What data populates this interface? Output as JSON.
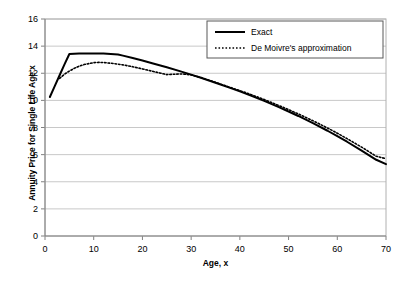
{
  "chart_data": {
    "type": "line",
    "title": "",
    "xlabel": "Age, x",
    "ylabel": "Annuity Price for Single Life Age x",
    "xlim": [
      0,
      70
    ],
    "ylim": [
      0,
      16
    ],
    "xticks": [
      0,
      10,
      20,
      30,
      40,
      50,
      60,
      70
    ],
    "yticks": [
      0,
      2,
      4,
      6,
      8,
      10,
      12,
      14,
      16
    ],
    "grid": "horizontal",
    "legend_position": "upper-right-inside",
    "series": [
      {
        "name": "Exact",
        "style": "solid",
        "color": "#000000",
        "x": [
          1,
          2,
          3,
          4,
          5,
          7,
          10,
          12,
          15,
          16,
          18,
          20,
          22,
          25,
          28,
          30,
          32,
          35,
          38,
          40,
          42,
          45,
          48,
          50,
          52,
          55,
          58,
          60,
          62,
          65,
          68,
          70
        ],
        "y": [
          10.25,
          11.05,
          11.85,
          12.65,
          13.42,
          13.45,
          13.46,
          13.45,
          13.38,
          13.3,
          13.12,
          12.94,
          12.74,
          12.44,
          12.12,
          11.9,
          11.67,
          11.3,
          10.92,
          10.66,
          10.39,
          9.96,
          9.5,
          9.18,
          8.85,
          8.32,
          7.76,
          7.36,
          6.95,
          6.3,
          5.62,
          5.3
        ]
      },
      {
        "name": "De Moivre's approximation",
        "style": "dotted",
        "color": "#000000",
        "x": [
          3,
          4,
          5,
          6,
          7,
          8,
          10,
          11,
          12,
          14,
          16,
          18,
          20,
          22,
          25,
          28,
          30,
          32,
          35,
          38,
          40,
          42,
          45,
          48,
          50,
          52,
          55,
          58,
          60,
          62,
          65,
          68,
          70
        ],
        "y": [
          11.62,
          11.93,
          12.16,
          12.36,
          12.52,
          12.64,
          12.78,
          12.8,
          12.79,
          12.72,
          12.62,
          12.48,
          12.32,
          12.15,
          11.9,
          11.95,
          11.88,
          11.68,
          11.33,
          10.96,
          10.72,
          10.47,
          10.06,
          9.62,
          9.32,
          9.0,
          8.5,
          7.96,
          7.58,
          7.18,
          6.55,
          5.88,
          5.7
        ]
      }
    ]
  },
  "legend": {
    "items": [
      {
        "label": "Exact"
      },
      {
        "label": "De Moivre's approximation"
      }
    ]
  },
  "axis": {
    "x_tick_labels": [
      "0",
      "10",
      "20",
      "30",
      "40",
      "50",
      "60",
      "70"
    ],
    "y_tick_labels": [
      "0",
      "2",
      "4",
      "6",
      "8",
      "10",
      "12",
      "14",
      "16"
    ]
  }
}
